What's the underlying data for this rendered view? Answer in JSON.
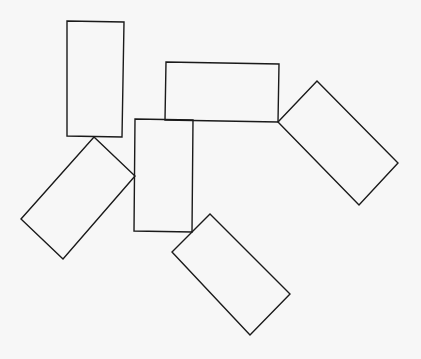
{
  "diagram": {
    "type": "rectangle-arrangement",
    "background": "#f7f7f7",
    "stroke_color": "#1a1a1a",
    "shapes": [
      {
        "id": "rect-top-left-vertical",
        "points": "67,21 124,22 122,137 67,136"
      },
      {
        "id": "rect-top-horizontal",
        "points": "166,62 279,64 278,122 165,120"
      },
      {
        "id": "rect-center-vertical",
        "points": "135,119 193,120 192,232 134,231"
      },
      {
        "id": "rect-left-rotated",
        "points": "94,137 135,176 63,259 21,219"
      },
      {
        "id": "rect-right-rotated",
        "points": "278,122 317,81 398,163 359,205"
      },
      {
        "id": "rect-bottom-rotated",
        "points": "192,232 210,214 290,294 250,335 172,252"
      }
    ]
  }
}
